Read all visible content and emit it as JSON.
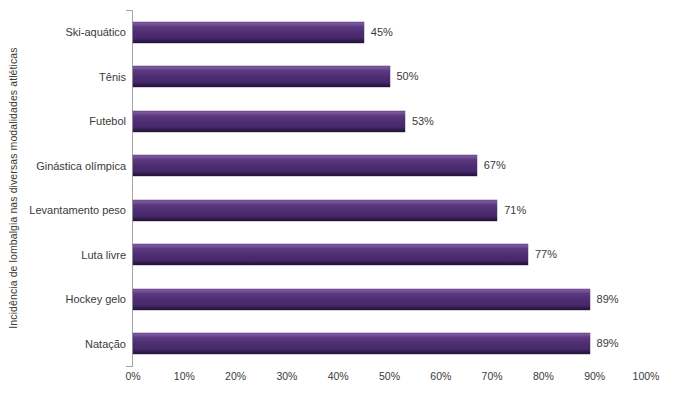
{
  "chart_data": {
    "type": "bar",
    "orientation": "horizontal",
    "title": "",
    "xlabel": "",
    "ylabel": "Incidência de lombalgia nas diversas modalidades atléticas",
    "xlim": [
      0,
      100
    ],
    "grid": false,
    "legend": null,
    "bar_color": "#4e2d73",
    "categories": [
      "Ski-aquático",
      "Tênis",
      "Futebol",
      "Ginástica olímpica",
      "Levantamento peso",
      "Luta livre",
      "Hockey gelo",
      "Natação"
    ],
    "values": [
      45,
      50,
      53,
      67,
      71,
      77,
      89,
      89
    ],
    "data_labels": [
      "45%",
      "50%",
      "53%",
      "67%",
      "71%",
      "77%",
      "89%",
      "89%"
    ],
    "x_tick_values": [
      0,
      10,
      20,
      30,
      40,
      50,
      60,
      70,
      80,
      90,
      100
    ],
    "x_tick_labels": [
      "0%",
      "10%",
      "20%",
      "30%",
      "40%",
      "50%",
      "60%",
      "70%",
      "80%",
      "90%",
      "100%"
    ]
  }
}
